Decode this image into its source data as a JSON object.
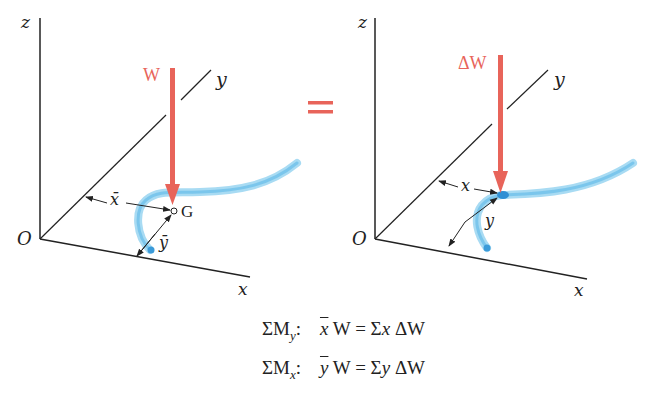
{
  "colors": {
    "force_arrow": "#e8645a",
    "rod": "#7cc4ea",
    "rod_core": "#3b9bd9",
    "axes": "#222222"
  },
  "left_figure": {
    "axis_labels": {
      "z": "z",
      "y": "y",
      "x": "x",
      "origin": "O"
    },
    "force_label": "W",
    "centroid_label": "G",
    "dim_x_label": "x̄",
    "dim_y_label": "ȳ"
  },
  "equals_sign": "=",
  "right_figure": {
    "axis_labels": {
      "z": "z",
      "y": "y",
      "x": "x",
      "origin": "O"
    },
    "force_label": "ΔW",
    "dim_x_label": "x",
    "dim_y_label": "y"
  },
  "equations": [
    {
      "label_main": "ΣM",
      "label_sub": "y",
      "colon": ":",
      "lhs_var": "x",
      "lhs_rest": " W = Σ",
      "rhs_var": "x",
      "rhs_rest": " ΔW"
    },
    {
      "label_main": "ΣM",
      "label_sub": "x",
      "colon": ":",
      "lhs_var": "y",
      "lhs_rest": " W = Σ",
      "rhs_var": "y",
      "rhs_rest": " ΔW"
    }
  ]
}
